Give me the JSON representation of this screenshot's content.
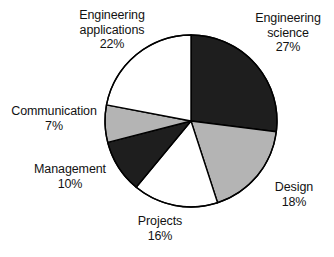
{
  "chart_data": {
    "type": "pie",
    "title": "",
    "subtitle": "",
    "xlabel": "",
    "ylabel": "",
    "legend_position": "none",
    "grid": false,
    "start_angle_deg": 0,
    "direction": "clockwise",
    "units": "percent",
    "total": 100,
    "categories": [
      "Engineering science",
      "Design",
      "Projects",
      "Management",
      "Communication",
      "Engineering applications"
    ],
    "values": [
      27,
      18,
      16,
      10,
      7,
      22
    ],
    "slices": [
      {
        "name": "Engineering science",
        "label_line1": "Engineering",
        "label_line2": "science",
        "value": 27,
        "value_label": "27%",
        "fill": "#1e1e1e",
        "stroke": "#000000"
      },
      {
        "name": "Design",
        "label_line1": "Design",
        "label_line2": "",
        "value": 18,
        "value_label": "18%",
        "fill": "#b4b4b4",
        "stroke": "#000000"
      },
      {
        "name": "Projects",
        "label_line1": "Projects",
        "label_line2": "",
        "value": 16,
        "value_label": "16%",
        "fill": "#ffffff",
        "stroke": "#000000"
      },
      {
        "name": "Management",
        "label_line1": "Management",
        "label_line2": "",
        "value": 10,
        "value_label": "10%",
        "fill": "#1e1e1e",
        "stroke": "#000000"
      },
      {
        "name": "Communication",
        "label_line1": "Communication",
        "label_line2": "",
        "value": 7,
        "value_label": "7%",
        "fill": "#b4b4b4",
        "stroke": "#000000"
      },
      {
        "name": "Engineering applications",
        "label_line1": "Engineering",
        "label_line2": "applications",
        "value": 22,
        "value_label": "22%",
        "fill": "#ffffff",
        "stroke": "#000000"
      }
    ],
    "colors": {
      "dark": "#1e1e1e",
      "grey": "#b4b4b4",
      "white": "#ffffff",
      "outline": "#000000",
      "background": "#ffffff",
      "text": "#121212"
    },
    "geometry": {
      "center_x": 191,
      "center_y": 121,
      "radius": 86
    }
  }
}
